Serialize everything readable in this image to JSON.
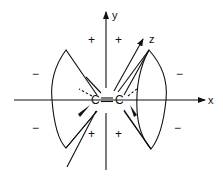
{
  "diagram": {
    "axes": {
      "x_label": "x",
      "y_label": "y",
      "z_label": "z"
    },
    "atoms": {
      "left": "C",
      "right": "C",
      "bond": "double"
    },
    "signs": {
      "top_left_lobe": "+",
      "top_right_lobe": "+",
      "bottom_left_lobe": "+",
      "bottom_right_lobe": "+",
      "left_upper": "−",
      "left_lower": "−",
      "right_upper": "−",
      "right_lower": "−"
    },
    "colors": {
      "ink": "#111111",
      "background": "#ffffff"
    }
  }
}
